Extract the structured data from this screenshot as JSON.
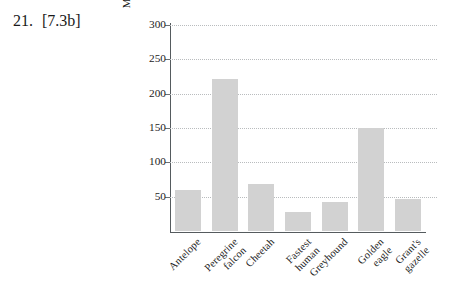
{
  "exercise": {
    "number": "21.",
    "objective": "[7.3b]"
  },
  "chart_data": {
    "type": "bar",
    "title": "",
    "xlabel": "",
    "ylabel": "Maximum speed (in miles per hour)",
    "categories": [
      "Antelope",
      "Peregrine falcon",
      "Cheetah",
      "Fastest human",
      "Greyhound",
      "Golden eagle",
      "Grant's gazelle"
    ],
    "values": [
      60,
      222,
      68,
      28,
      42,
      150,
      47
    ],
    "ylim": [
      0,
      300
    ],
    "yticks": [
      50,
      100,
      150,
      200,
      250,
      300
    ],
    "ytick_labels": [
      "50",
      "100",
      "150",
      "200",
      "250",
      "300"
    ],
    "grid": "horizontal-dotted",
    "legend": "none",
    "bar_color": "#d2d2d2",
    "axis_color": "#555b5e",
    "grid_color": "#b9bcbe"
  }
}
